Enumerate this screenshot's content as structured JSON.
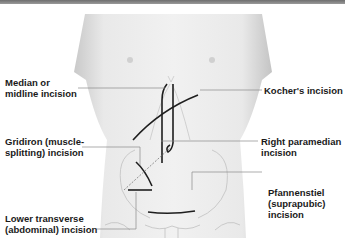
{
  "figure": {
    "type": "anatomical-diagram"
  },
  "labels": [
    {
      "id": "median",
      "text": "Median or\nmidline incision",
      "side": "left"
    },
    {
      "id": "kocher",
      "text": "Kocher's incision",
      "side": "right"
    },
    {
      "id": "gridiron",
      "text": "Gridiron (muscle-\nsplitting) incision",
      "side": "left"
    },
    {
      "id": "paramedian",
      "text": "Right paramedian\nincision",
      "side": "right"
    },
    {
      "id": "pfannenstiel",
      "text": "Pfannenstiel\n(suprapubic)\nincision",
      "side": "right"
    },
    {
      "id": "lower_transverse",
      "text": "Lower transverse\n(abdominal) incision",
      "side": "left"
    }
  ],
  "colors": {
    "skin": "#e6e6e6",
    "incision": "#1e1e1e",
    "leader": "#8a8a8a",
    "text": "#1a1a1a"
  }
}
